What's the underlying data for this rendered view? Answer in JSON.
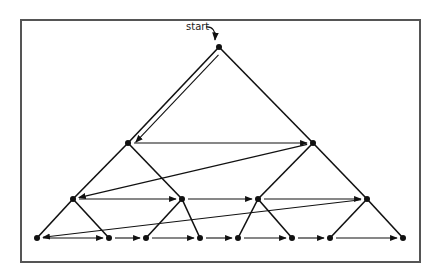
{
  "diagram": {
    "type": "tree-traversal",
    "start_label": "start",
    "colors": {
      "line": "#111111",
      "frame": "#555555"
    },
    "nodes": [
      {
        "id": "n0",
        "x": 219,
        "y": 47
      },
      {
        "id": "n1",
        "x": 128,
        "y": 143
      },
      {
        "id": "n2",
        "x": 313,
        "y": 143
      },
      {
        "id": "n3",
        "x": 73,
        "y": 199
      },
      {
        "id": "n4",
        "x": 182,
        "y": 199
      },
      {
        "id": "n5",
        "x": 258,
        "y": 199
      },
      {
        "id": "n6",
        "x": 367,
        "y": 199
      },
      {
        "id": "n7",
        "x": 37,
        "y": 238
      },
      {
        "id": "n8",
        "x": 109,
        "y": 238
      },
      {
        "id": "n9",
        "x": 146,
        "y": 238
      },
      {
        "id": "n10",
        "x": 200,
        "y": 238
      },
      {
        "id": "n11",
        "x": 238,
        "y": 238
      },
      {
        "id": "n12",
        "x": 292,
        "y": 238
      },
      {
        "id": "n13",
        "x": 330,
        "y": 238
      },
      {
        "id": "n14",
        "x": 403,
        "y": 238
      }
    ],
    "tree_edges": [
      [
        "n0",
        "n1"
      ],
      [
        "n0",
        "n2"
      ],
      [
        "n1",
        "n3"
      ],
      [
        "n1",
        "n4"
      ],
      [
        "n2",
        "n5"
      ],
      [
        "n2",
        "n6"
      ],
      [
        "n3",
        "n7"
      ],
      [
        "n3",
        "n8"
      ],
      [
        "n4",
        "n9"
      ],
      [
        "n4",
        "n10"
      ],
      [
        "n5",
        "n11"
      ],
      [
        "n5",
        "n12"
      ],
      [
        "n6",
        "n13"
      ],
      [
        "n6",
        "n14"
      ]
    ],
    "traversal_arrows": [
      [
        "n0",
        "n1"
      ],
      [
        "n1",
        "n2"
      ],
      [
        "n2",
        "n3"
      ],
      [
        "n3",
        "n4"
      ],
      [
        "n4",
        "n5"
      ],
      [
        "n5",
        "n6"
      ],
      [
        "n6",
        "n7"
      ],
      [
        "n7",
        "n8"
      ],
      [
        "n8",
        "n9"
      ],
      [
        "n9",
        "n10"
      ],
      [
        "n10",
        "n11"
      ],
      [
        "n11",
        "n12"
      ],
      [
        "n12",
        "n13"
      ],
      [
        "n13",
        "n14"
      ]
    ]
  }
}
